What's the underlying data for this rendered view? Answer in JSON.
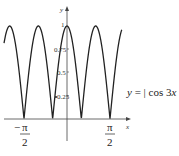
{
  "chart_data": {
    "type": "line",
    "title": "",
    "function": "y = |cos 3x|",
    "series": [
      {
        "name": "y = |cos 3x|",
        "formula": "abs(cos(3x))"
      }
    ],
    "xlabel": "x",
    "ylabel": "y",
    "x_range": [
      -2.3,
      2.0
    ],
    "ylim": [
      0,
      1
    ],
    "x_ticks": [
      {
        "value": -1.5708,
        "label_num": "π",
        "label_den": "2",
        "sign": "−"
      },
      {
        "value": 1.5708,
        "label_num": "π",
        "label_den": "2",
        "sign": ""
      }
    ],
    "y_ticks": [
      {
        "value": 0.25,
        "label": "0.25"
      },
      {
        "value": 0.5,
        "label": "0.5"
      },
      {
        "value": 0.75,
        "label": "0.75"
      },
      {
        "value": 1,
        "label": "1"
      }
    ],
    "zeros": [
      "-π/2",
      "-π/6",
      "π/6",
      "π/2"
    ],
    "grid": false,
    "legend": "annotation on right"
  },
  "labels": {
    "y_axis": "y",
    "x_axis": "x",
    "equation_prefix": "y",
    "equation_eq": " = | ",
    "equation_func": "cos",
    "equation_arg": " 3",
    "equation_var": "x",
    "equation_suffix": " |",
    "tick_1": "1",
    "tick_075": "0.75",
    "tick_05": "0.5",
    "tick_025": "0.25",
    "pi": "π",
    "two": "2",
    "minus": "−"
  }
}
